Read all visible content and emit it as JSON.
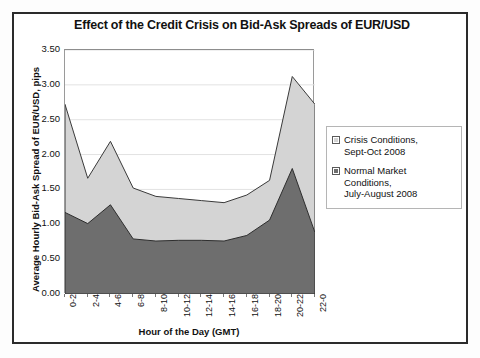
{
  "figure": {
    "title": "Effect of the Credit Crisis on Bid-Ask Spreads of EUR/USD"
  },
  "chart_data": {
    "type": "area",
    "stacked": false,
    "title": "Effect of the Credit Crisis on Bid-Ask Spreads of EUR/USD",
    "xlabel": "Hour of the Day (GMT)",
    "ylabel": "Average Hourly Bid-Ask Spread of EUR/USD, pips",
    "categories": [
      "0-2",
      "2-4",
      "4-6",
      "6-8",
      "8-10",
      "10-12",
      "12-14",
      "14-16",
      "16-18",
      "18-20",
      "20-22",
      "22-0"
    ],
    "series": [
      {
        "name": "Crisis Conditions, Sept-Oct 2008",
        "color": "#d4d4d4",
        "values": [
          2.72,
          1.66,
          2.19,
          1.52,
          1.4,
          1.37,
          1.34,
          1.31,
          1.42,
          1.63,
          3.12,
          2.72
        ]
      },
      {
        "name": "Normal Market Conditions, July-August 2008",
        "color": "#6e6e6e",
        "values": [
          1.17,
          1.01,
          1.28,
          0.79,
          0.76,
          0.77,
          0.77,
          0.76,
          0.84,
          1.06,
          1.8,
          0.88
        ]
      }
    ],
    "ylim": [
      0.0,
      3.5
    ],
    "ytick_labels": [
      "3.50",
      "3.00",
      "2.50",
      "2.00",
      "1.50",
      "1.00",
      "0.50",
      "0.00"
    ],
    "ytick_values": [
      3.5,
      3.0,
      2.5,
      2.0,
      1.5,
      1.0,
      0.5,
      0.0
    ],
    "grid": true,
    "legend_position": "right"
  },
  "legend": {
    "entries": [
      {
        "label_line1": "Crisis Conditions,",
        "label_line2": "Sept-Oct 2008",
        "color": "#d4d4d4"
      },
      {
        "label_line1": "Normal Market Conditions,",
        "label_line2": "July-August 2008",
        "color": "#6e6e6e"
      }
    ]
  }
}
